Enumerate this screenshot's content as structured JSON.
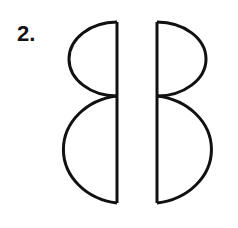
{
  "item": {
    "number_label": "2."
  },
  "figure": {
    "stroke_color": "#111111",
    "fill_color": "#ffffff",
    "shapes": [
      {
        "name": "left-mirrored-b",
        "orientation": "facing-left"
      },
      {
        "name": "right-b",
        "orientation": "facing-right"
      }
    ]
  }
}
